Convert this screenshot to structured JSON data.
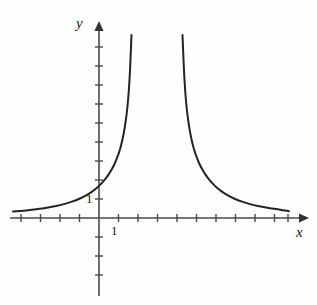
{
  "figure": {
    "name": "rational-function-graph",
    "background_color": "#fefefe",
    "ink_color": "#232323",
    "axis_color": "#4a4a4a"
  },
  "axes": {
    "x_axis": {
      "label": "x",
      "origin_px": [
        99,
        218
      ],
      "start_px": [
        10,
        218
      ],
      "end_px": [
        305,
        218
      ],
      "arrow": "right",
      "tick_spacing_px": 19.5,
      "ticks_left_of_origin": 4,
      "ticks_right_of_origin": 10,
      "tick_half_length_px": 4
    },
    "y_axis": {
      "label": "y",
      "origin_px": [
        99,
        218
      ],
      "start_px": [
        99,
        296
      ],
      "end_px": [
        99,
        22
      ],
      "arrow": "up",
      "tick_spacing_px": 19.0,
      "ticks_above_origin": 9,
      "ticks_below_origin": 3,
      "tick_half_length_px": 4
    }
  },
  "tick_labels": {
    "x_one": "1",
    "y_one": "1"
  },
  "chart_data": {
    "type": "line",
    "title": "",
    "xlabel": "x",
    "ylabel": "y",
    "grid": false,
    "legend": null,
    "axis_unit_px": {
      "x": 19.5,
      "y": 19.0
    },
    "origin_px": [
      99,
      218
    ],
    "xlim_px": [
      10,
      305
    ],
    "ylim_px": [
      296,
      22
    ],
    "labeled_ticks": {
      "x": [
        1
      ],
      "y": [
        1
      ]
    },
    "annotations": [],
    "asymptotes": {
      "vertical_px": [
        131.5,
        182.5
      ],
      "horizontal_px": [
        218
      ],
      "symmetry_axis_px": 157
    },
    "series": [
      {
        "name": "left-branch",
        "comment": "Decreasing-then-rising curve on the left of the left asymptote; tail hugs y=0 at far left, climbs through (0,~1.5) and shoots up near x-asymptote.",
        "points_px": [
          [
            13,
            211.5
          ],
          [
            20,
            211.0
          ],
          [
            28,
            210.3
          ],
          [
            36,
            209.4
          ],
          [
            44,
            208.3
          ],
          [
            52,
            206.9
          ],
          [
            60,
            205.2
          ],
          [
            68,
            203.0
          ],
          [
            76,
            200.3
          ],
          [
            84,
            196.7
          ],
          [
            90,
            193.2
          ],
          [
            95,
            189.5
          ],
          [
            99,
            186.0
          ],
          [
            103,
            181.8
          ],
          [
            107,
            176.8
          ],
          [
            110,
            172.4
          ],
          [
            113,
            167.2
          ],
          [
            116,
            160.8
          ],
          [
            119,
            152.6
          ],
          [
            121,
            145.8
          ],
          [
            123,
            137.3
          ],
          [
            125,
            126.0
          ],
          [
            126.5,
            115.5
          ],
          [
            128,
            101.5
          ],
          [
            129,
            88.5
          ],
          [
            130,
            71.0
          ],
          [
            130.7,
            55.0
          ],
          [
            131.2,
            42.0
          ],
          [
            131.5,
            35.0
          ]
        ]
      },
      {
        "name": "right-branch",
        "comment": "Mirror image of the left branch about the symmetry axis; drops from the right asymptote and decays toward y=0 at far right.",
        "points_px": [
          [
            182.5,
            35.0
          ],
          [
            182.8,
            42.0
          ],
          [
            183.3,
            55.0
          ],
          [
            184,
            71.0
          ],
          [
            185,
            88.5
          ],
          [
            186,
            101.5
          ],
          [
            187.5,
            115.5
          ],
          [
            189,
            126.0
          ],
          [
            191,
            137.3
          ],
          [
            193,
            145.8
          ],
          [
            195,
            152.6
          ],
          [
            198,
            160.8
          ],
          [
            201,
            167.2
          ],
          [
            204,
            172.4
          ],
          [
            207,
            176.8
          ],
          [
            211,
            181.8
          ],
          [
            215,
            186.0
          ],
          [
            219,
            189.5
          ],
          [
            224,
            193.2
          ],
          [
            230,
            196.7
          ],
          [
            238,
            200.3
          ],
          [
            246,
            203.0
          ],
          [
            254,
            205.2
          ],
          [
            262,
            206.9
          ],
          [
            270,
            208.3
          ],
          [
            278,
            209.4
          ],
          [
            285,
            210.5
          ],
          [
            289,
            211.2
          ]
        ]
      }
    ]
  }
}
